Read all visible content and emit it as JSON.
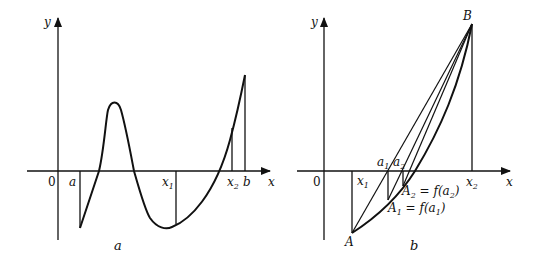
{
  "figure_a": {
    "caption": "a",
    "axes": {
      "x_label": "x",
      "y_label": "y",
      "origin_label": "0"
    },
    "ticks": [
      {
        "label": "a",
        "sub": ""
      },
      {
        "label": "x",
        "sub": "1"
      },
      {
        "label": "x",
        "sub": "2"
      },
      {
        "label": "b",
        "sub": ""
      }
    ]
  },
  "figure_b": {
    "caption": "b",
    "axes": {
      "x_label": "x",
      "y_label": "y",
      "origin_label": "0"
    },
    "points": {
      "A": "A",
      "B": "B"
    },
    "ticks": [
      {
        "label": "x",
        "sub": "1"
      },
      {
        "label": "a",
        "sub": "1"
      },
      {
        "label": "a",
        "sub": "2"
      },
      {
        "label": "x",
        "sub": "2"
      }
    ],
    "annotations": {
      "A2_label": "A",
      "A2_sub": "2",
      "A2_eq": " = f(a",
      "A2_eq_sub": "2",
      "A2_close": ")",
      "A1_label": "A",
      "A1_sub": "1",
      "A1_eq": " = f(a",
      "A1_eq_sub": "1",
      "A1_close": ")"
    }
  },
  "colors": {
    "stroke": "#111111",
    "background": "#ffffff"
  }
}
